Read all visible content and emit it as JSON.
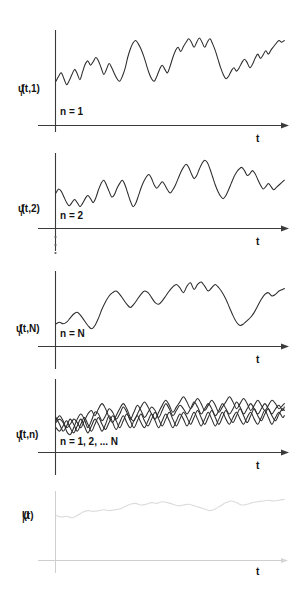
{
  "figure": {
    "background_color": "#ffffff",
    "ink_color": "#2b2b2b",
    "faint_ink_color": "#dcdcdc",
    "panels": [
      {
        "id": "panel-ensemble-1",
        "y_label_base": "u",
        "y_label_sup": "*",
        "y_label_sub": "i",
        "y_label_rest": "(t,1)",
        "n_label": "n = 1",
        "t_label": "t",
        "faint": false
      },
      {
        "id": "panel-ensemble-2",
        "y_label_base": "u",
        "y_label_sup": "*",
        "y_label_sub": "i",
        "y_label_rest": "(t,2)",
        "n_label": "n = 2",
        "t_label": "t",
        "faint": false
      },
      {
        "id": "panel-ensemble-N",
        "y_label_base": "u",
        "y_label_sup": "*",
        "y_label_sub": "i",
        "y_label_rest": "(t,N)",
        "n_label": "n = N",
        "t_label": "t",
        "faint": false
      },
      {
        "id": "panel-ensemble-overlay",
        "y_label_base": "u",
        "y_label_sup": "*",
        "y_label_sub": "i",
        "y_label_rest": "(t,n)",
        "n_label": "n = 1, 2, ... N",
        "t_label": "t",
        "faint": false
      },
      {
        "id": "panel-mean",
        "y_label_base": "U",
        "y_label_sup": "",
        "y_label_sub": "i",
        "y_label_rest": "(t)",
        "n_label": "",
        "t_label": "t",
        "faint": true
      }
    ],
    "vertical_ellipsis": "⋮"
  },
  "chart_data": {
    "type": "line",
    "title": "",
    "xlabel": "t",
    "ylabel": "u*_i(t,n)",
    "grid": false,
    "legend": "none",
    "series": [
      {
        "name": "u*_i(t,1)",
        "panel": "panel-ensemble-1",
        "points": "M 0,58 L 3,52 6,48 9,55 12,62 15,57 18,50 21,44 24,49 27,56 30,47 33,38 36,34 39,39 42,35 45,30 48,34 51,42 54,50 57,44 60,37 63,42 66,49 69,55 72,58 75,52 78,43 81,30 84,20 87,13 90,10 93,14 96,20 99,28 102,38 105,48 108,55 111,58 114,52 117,44 120,39 123,44 126,48 129,40 132,30 135,22 138,18 141,23 144,17 147,12 150,8 153,12 156,18 159,12 162,7 165,12 168,18 171,12 174,8 177,14 180,22 183,32 186,42 189,50 192,55 195,52 198,46 201,42 204,46 207,42 210,36 213,32 216,36 219,42 222,38 225,31 228,26 231,31 234,27 237,22 240,26 243,21 246,17 249,13 252,10 255,12 258,10"
      },
      {
        "name": "u*_i(t,2)",
        "panel": "panel-ensemble-2",
        "points": "M 0,50 L 3,45 6,48 9,55 12,62 15,66 18,62 21,58 24,62 27,67 30,63 33,57 36,53 39,57 42,62 45,56 48,46 51,38 54,34 57,40 60,48 63,55 66,52 69,44 72,38 75,34 78,40 81,50 84,60 87,67 90,63 93,54 96,44 99,36 102,30 105,27 108,32 111,40 114,44 117,40 120,36 123,40 126,46 129,50 132,46 135,40 138,32 141,24 144,18 147,14 150,18 153,26 156,32 159,28 162,20 165,13 168,9 171,12 174,20 177,30 180,40 183,48 186,54 189,57 192,53 195,46 198,38 201,30 204,24 207,20 210,18 213,22 216,28 219,26 222,22 225,26 228,33 231,40 234,45 237,42 240,38 243,42 246,46 249,43 252,40 255,37 258,34"
      },
      {
        "name": "u*_i(t,N)",
        "panel": "panel-ensemble-N",
        "points": "M 0,62 L 4,60 8,62 12,60 16,55 20,50 24,48 28,52 32,58 36,64 40,68 44,64 48,55 52,44 56,35 60,28 64,24 68,22 72,26 76,32 80,38 84,42 88,38 92,32 96,26 100,22 104,24 108,30 112,36 116,38 120,34 124,28 128,22 132,17 136,14 140,18 144,24 148,16 152,12 156,20 160,14 164,11 168,16 172,22 176,18 180,14 184,18 188,24 192,32 196,42 200,52 204,60 208,64 212,62 216,58 220,54 224,48 228,40 232,32 236,26 240,24 244,28 248,26 252,22 256,20 258,19"
      },
      {
        "name": "overlay-curve-1",
        "panel": "panel-ensemble-overlay",
        "points": "M 0,46 L 4,42 8,46 12,52 16,48 20,42 24,46 28,52 32,44 36,36 40,32 44,38 48,30 52,24 56,30 60,40 64,46 68,38 72,30 76,24 80,30 84,40 88,44 92,36 96,28 100,22 104,28 108,36 112,42 116,34 120,26 124,20 128,26 132,34 136,28 140,22 144,16 148,22 152,30 156,24 160,18 164,24 168,32 172,26 176,20 180,26 184,34 188,28 192,22 196,16 200,22 204,30 208,24 212,18 216,24 220,32 224,26 228,20 232,26 236,32 240,26 244,20 248,24 252,30 256,26 258,24"
      },
      {
        "name": "overlay-curve-2",
        "panel": "panel-ensemble-overlay",
        "points": "M 0,40 L 4,48 8,56 12,50 16,42 20,48 24,56 28,48 32,40 36,48 40,56 44,48 48,40 52,48 56,54 60,46 64,38 68,44 72,52 76,44 80,36 84,44 88,52 92,44 96,36 100,44 104,50 108,42 112,34 116,42 120,50 124,42 128,34 132,42 136,50 140,42 144,34 148,40 152,48 156,40 160,32 164,40 168,48 172,40 176,32 180,40 184,48 188,40 192,32 196,40 200,46 204,38 208,30 212,38 216,46 220,38 224,30 228,38 232,44 236,36 240,30 244,38 248,44 252,36 256,30 258,32"
      },
      {
        "name": "overlay-curve-3",
        "panel": "panel-ensemble-overlay",
        "points": "M 0,52 L 4,56 8,50 12,44 16,52 20,58 24,50 28,42 32,50 36,58 40,50 44,42 48,48 52,56 56,48 60,38 64,46 68,54 72,46 76,38 80,46 84,52 88,44 92,38 96,46 100,52 104,44 108,36 112,44 116,52 120,44 124,36 128,44 132,52 136,44 140,36 144,42 148,50 152,42 156,34 160,42 164,50 168,42 172,34 176,42 180,50 184,42 188,34 192,42 196,48 200,40 204,34 208,42 212,48 216,40 220,34 224,42 228,48 232,40 236,32 240,40 244,48 248,40 252,34 256,40 258,38"
      },
      {
        "name": "overlay-curve-4",
        "panel": "panel-ensemble-overlay",
        "points": "M 0,44 L 4,38 8,44 12,56 16,60 20,52 24,42 28,36 32,42 36,52 40,44 44,34 48,36 52,44 56,38 60,30 64,34 68,42 72,36 76,28 80,34 84,42 88,34 92,26 96,32 100,40 104,34 108,28 112,32 116,40 120,32 124,24 128,30 132,38 136,32 140,26 144,30 148,36 152,30 156,22 160,28 164,36 168,30 172,24 176,30 180,38 184,32 188,24 192,30 196,36 200,30 204,22 208,28 212,36 216,30 220,24 224,30 228,36 232,30 236,24 240,30 244,36 248,30 252,26 256,32 258,28"
      },
      {
        "name": "U_i(t)",
        "panel": "panel-mean",
        "points": "M 0,28 L 6,30 12,29 18,31 24,28 30,24 36,22 42,23 48,22 54,21 60,22 66,21 72,20 78,17 84,14 90,13 96,15 102,14 108,12 114,13 120,11 126,12 132,14 138,16 144,15 150,14 156,16 162,18 168,20 174,22 180,20 186,16 192,12 198,10 204,12 210,15 216,14 222,12 228,11 234,10 240,9 246,10 252,9 258,8"
      }
    ]
  }
}
